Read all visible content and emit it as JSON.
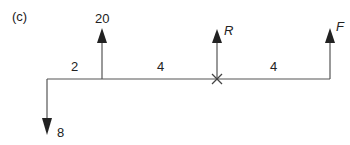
{
  "figure": {
    "label": "(c)",
    "colors": {
      "line": "#444444",
      "text": "#222222",
      "background": "#ffffff"
    }
  },
  "forces": [
    {
      "name": "downward-load",
      "label": "8",
      "direction": "down",
      "position": 0
    },
    {
      "name": "upward-load",
      "label": "20",
      "direction": "up",
      "position": 2
    },
    {
      "name": "reaction",
      "label": "R",
      "direction": "up",
      "position": 6
    },
    {
      "name": "applied-force",
      "label": "F",
      "direction": "up",
      "position": 10
    }
  ],
  "spans": [
    {
      "label": "2"
    },
    {
      "label": "4"
    },
    {
      "label": "4"
    }
  ],
  "pivot": {
    "symbol": "×",
    "position": 6
  }
}
